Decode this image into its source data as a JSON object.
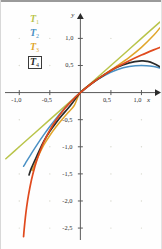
{
  "figure": {
    "background_color": "#fefefe",
    "axis_color": "#5a5a5a",
    "grid_dot_color": "#d9d9cf"
  },
  "legend": {
    "items": [
      {
        "name": "T1",
        "label": "T",
        "sub": "1",
        "color": "#b9c44a",
        "selected": false
      },
      {
        "name": "T2",
        "label": "T",
        "sub": "2",
        "color": "#4a90c4",
        "selected": false
      },
      {
        "name": "T3",
        "label": "T",
        "sub": "3",
        "color": "#e0a52a",
        "selected": false
      },
      {
        "name": "T4",
        "label": "T",
        "sub": "4",
        "color": "#2b2b2b",
        "selected": true
      }
    ]
  },
  "chart_data": {
    "type": "line",
    "title": "",
    "xlabel": "x",
    "ylabel": "y",
    "xlim": [
      -1.25,
      1.32
    ],
    "ylim": [
      -2.72,
      1.45
    ],
    "grid": "dots",
    "legend_position": "top-left",
    "xticks": [
      {
        "value": -1.0,
        "label": "-1,0"
      },
      {
        "value": -0.5,
        "label": "-0,5"
      },
      {
        "value": 0.5,
        "label": "0,5"
      },
      {
        "value": 1.0,
        "label": "1,0"
      }
    ],
    "yticks": [
      {
        "value": 1.0,
        "label": "1,0"
      },
      {
        "value": 0.5,
        "label": "0,5"
      },
      {
        "value": -0.5,
        "label": "-0,5"
      },
      {
        "value": -1.0,
        "label": "-1,0"
      },
      {
        "value": -1.5,
        "label": "-1,5"
      },
      {
        "value": -2.0,
        "label": "-2,0"
      },
      {
        "value": -2.5,
        "label": "-2,5"
      }
    ],
    "series": [
      {
        "name": "T1",
        "color": "#b9c44a",
        "points": [
          [
            -1.22,
            -1.22
          ],
          [
            -1.0,
            -1.0
          ],
          [
            -0.75,
            -0.75
          ],
          [
            -0.5,
            -0.5
          ],
          [
            -0.25,
            -0.25
          ],
          [
            0,
            0
          ],
          [
            0.25,
            0.25
          ],
          [
            0.5,
            0.5
          ],
          [
            0.75,
            0.75
          ],
          [
            1.0,
            1.0
          ],
          [
            1.3,
            1.3
          ]
        ]
      },
      {
        "name": "T2",
        "color": "#4a90c4",
        "points": [
          [
            -0.93,
            -1.36
          ],
          [
            -0.9,
            -1.305
          ],
          [
            -0.8,
            -1.12
          ],
          [
            -0.7,
            -0.945
          ],
          [
            -0.6,
            -0.78
          ],
          [
            -0.5,
            -0.625
          ],
          [
            -0.4,
            -0.48
          ],
          [
            -0.3,
            -0.345
          ],
          [
            -0.2,
            -0.22
          ],
          [
            -0.1,
            -0.105
          ],
          [
            0,
            0
          ],
          [
            0.2,
            0.18
          ],
          [
            0.4,
            0.32
          ],
          [
            0.6,
            0.42
          ],
          [
            0.8,
            0.48
          ],
          [
            1.0,
            0.5
          ],
          [
            1.2,
            0.48
          ],
          [
            1.3,
            0.455
          ]
        ]
      },
      {
        "name": "T3",
        "color": "#e0a52a",
        "points": [
          [
            -0.79,
            -1.44
          ],
          [
            -0.75,
            -1.33
          ],
          [
            -0.7,
            -1.2
          ],
          [
            -0.6,
            -0.972
          ],
          [
            -0.5,
            -0.7916
          ],
          [
            -0.4,
            -0.6346
          ],
          [
            -0.3,
            -0.4965
          ],
          [
            -0.2,
            -0.3693
          ],
          [
            -0.1,
            -0.2383
          ],
          [
            0,
            0
          ],
          [
            0.2,
            0.1827
          ],
          [
            0.4,
            0.3413
          ],
          [
            0.6,
            0.492
          ],
          [
            0.8,
            0.6506
          ],
          [
            1.0,
            0.8333
          ],
          [
            1.2,
            1.056
          ],
          [
            1.3,
            1.19
          ]
        ]
      },
      {
        "name": "T4",
        "color": "#2b2b2b",
        "points": [
          [
            -0.84,
            -1.52
          ],
          [
            -0.8,
            -1.39
          ],
          [
            -0.7,
            -1.14
          ],
          [
            -0.6,
            -0.9
          ],
          [
            -0.5,
            -0.7136
          ],
          [
            -0.4,
            -0.5586
          ],
          [
            -0.3,
            -0.4185
          ],
          [
            -0.2,
            -0.2893
          ],
          [
            -0.1,
            -0.1458
          ],
          [
            0,
            0
          ],
          [
            0.2,
            0.1823
          ],
          [
            0.4,
            0.3349
          ],
          [
            0.6,
            0.468
          ],
          [
            0.8,
            0.5484
          ],
          [
            1.0,
            0.5833
          ],
          [
            1.1,
            0.575
          ],
          [
            1.2,
            0.538
          ],
          [
            1.3,
            0.476
          ],
          [
            1.32,
            0.46
          ]
        ]
      },
      {
        "name": "exact",
        "color": "#e04a1e",
        "points": [
          [
            -0.93,
            -2.66
          ],
          [
            -0.92,
            -2.525
          ],
          [
            -0.9,
            -2.3026
          ],
          [
            -0.88,
            -2.12
          ],
          [
            -0.85,
            -1.897
          ],
          [
            -0.8,
            -1.609
          ],
          [
            -0.75,
            -1.386
          ],
          [
            -0.7,
            -1.204
          ],
          [
            -0.6,
            -0.9163
          ],
          [
            -0.5,
            -0.6931
          ],
          [
            -0.4,
            -0.5108
          ],
          [
            -0.3,
            -0.3567
          ],
          [
            -0.2,
            -0.2231
          ],
          [
            -0.1,
            -0.1054
          ],
          [
            0,
            0
          ],
          [
            0.2,
            0.1823
          ],
          [
            0.4,
            0.3365
          ],
          [
            0.6,
            0.47
          ],
          [
            0.8,
            0.5878
          ],
          [
            1.0,
            0.6931
          ],
          [
            1.2,
            0.7885
          ],
          [
            1.3,
            0.8329
          ]
        ]
      }
    ]
  }
}
